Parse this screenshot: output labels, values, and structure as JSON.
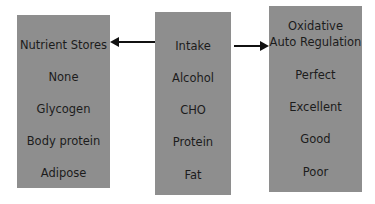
{
  "diagram": {
    "left_box": {
      "title": "Nutrient Stores",
      "items": [
        "None",
        "Glycogen",
        "Body protein",
        "Adipose"
      ]
    },
    "center_box": {
      "title": "Intake",
      "items": [
        "Alcohol",
        "CHO",
        "Protein",
        "Fat"
      ]
    },
    "right_box": {
      "title_line1": "Oxidative",
      "title_line2": "Auto Regulation",
      "items": [
        "Perfect",
        "Excellent",
        "Good",
        "Poor"
      ]
    },
    "arrows": [
      {
        "from": "Intake",
        "to": "Nutrient Stores",
        "direction": "left"
      },
      {
        "from": "Intake",
        "to": "Oxidative Auto Regulation",
        "direction": "right"
      }
    ],
    "colors": {
      "box": "#8e8e8e",
      "text": "#1c1c1c",
      "arrow": "#111111"
    }
  }
}
